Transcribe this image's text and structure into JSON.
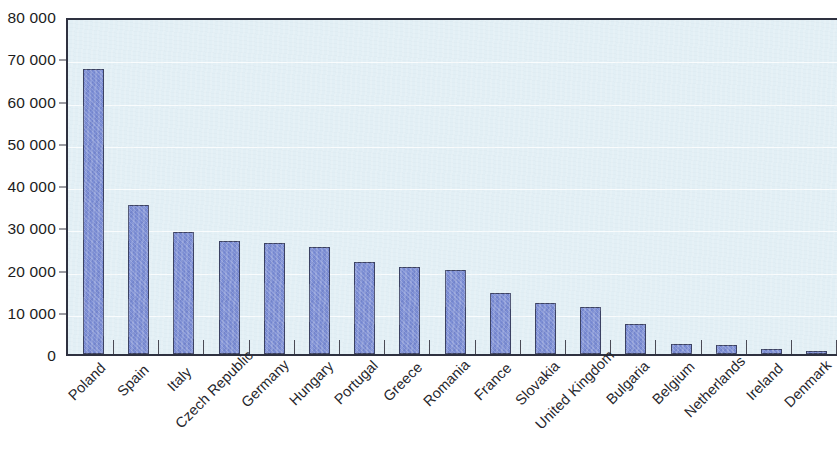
{
  "chart_data": {
    "type": "bar",
    "title": "",
    "subtitle": "",
    "xlabel": "",
    "ylabel": "",
    "ylim": [
      0,
      80000
    ],
    "grid": true,
    "legend": "none",
    "orientation": "vertical",
    "bar_color": "#7c8ed5",
    "bar_edge_color": "#3c4263",
    "plot_background_color": "#e2eff5",
    "axis_color": "#2e3140",
    "thousands_separator": " ",
    "y_ticks": [
      0,
      10000,
      20000,
      30000,
      40000,
      50000,
      60000,
      70000,
      80000
    ],
    "y_tick_labels": [
      "0",
      "10 000",
      "20 000",
      "30 000",
      "40 000",
      "50 000",
      "60 000",
      "70 000",
      "80 000"
    ],
    "categories": [
      "Poland",
      "Spain",
      "Italy",
      "Czech Republic",
      "Germany",
      "Hungary",
      "Portugal",
      "Greece",
      "Romania",
      "France",
      "Slovakia",
      "United Kingdom",
      "Bulgaria",
      "Belgium",
      "Netherlands",
      "Ireland",
      "Denmark"
    ],
    "values": [
      67500,
      35200,
      28800,
      26700,
      26300,
      25300,
      21700,
      20700,
      19900,
      14500,
      12000,
      11100,
      7000,
      2400,
      2200,
      1100,
      500
    ]
  }
}
